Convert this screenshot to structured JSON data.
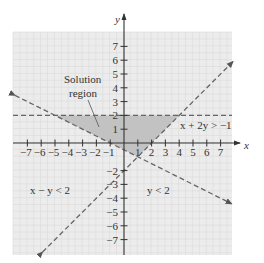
{
  "chart_data": {
    "type": "inequality-region",
    "title": "",
    "xlabel": "x",
    "ylabel": "y",
    "xlim": [
      -8,
      8
    ],
    "ylim": [
      -8,
      8
    ],
    "x_ticks": [
      -7,
      -6,
      -5,
      -4,
      -3,
      -2,
      -1,
      1,
      2,
      3,
      4,
      5,
      6,
      7
    ],
    "y_ticks": [
      -7,
      -6,
      -5,
      -4,
      -3,
      -2,
      1,
      2,
      3,
      4,
      5,
      6,
      7
    ],
    "x_tick_labels": [
      "−7",
      "−6",
      "−5",
      "−4",
      "−3",
      "−2",
      "−1",
      "1",
      "2",
      "3",
      "4",
      "5",
      "6",
      "7"
    ],
    "y_tick_labels": [
      "−7",
      "−6",
      "−5",
      "−4",
      "−3",
      "−2",
      "1",
      "2",
      "3",
      "4",
      "5",
      "6",
      "7"
    ],
    "grid": true,
    "lines": [
      {
        "name": "y < 2",
        "equation": "y = 2",
        "style": "dashed",
        "label": "y < 2"
      },
      {
        "name": "x − y < 2",
        "equation": "y = x − 2",
        "style": "dashed",
        "label": "x − y < 2"
      },
      {
        "name": "x + 2y > −1",
        "equation": "y = (−1 − x)/2",
        "style": "dashed",
        "label": "x + 2y > −1"
      }
    ],
    "solution_region": {
      "label": "Solution region",
      "vertices": [
        [
          -5,
          2
        ],
        [
          4,
          2
        ],
        [
          1,
          -1
        ]
      ]
    },
    "colors": {
      "background_grid": "#ececec",
      "grid_line": "#dadada",
      "shaded_region": "#c2c2c2",
      "line": "#666666",
      "axis": "#333333"
    }
  },
  "labels": {
    "x_axis": "x",
    "y_axis": "y",
    "solution_line1": "Solution",
    "solution_line2": "region",
    "ineq_x_plus_2y": "x + 2y > −1",
    "ineq_x_minus_y": "x − y < 2",
    "ineq_y_lt_2": "y < 2"
  }
}
